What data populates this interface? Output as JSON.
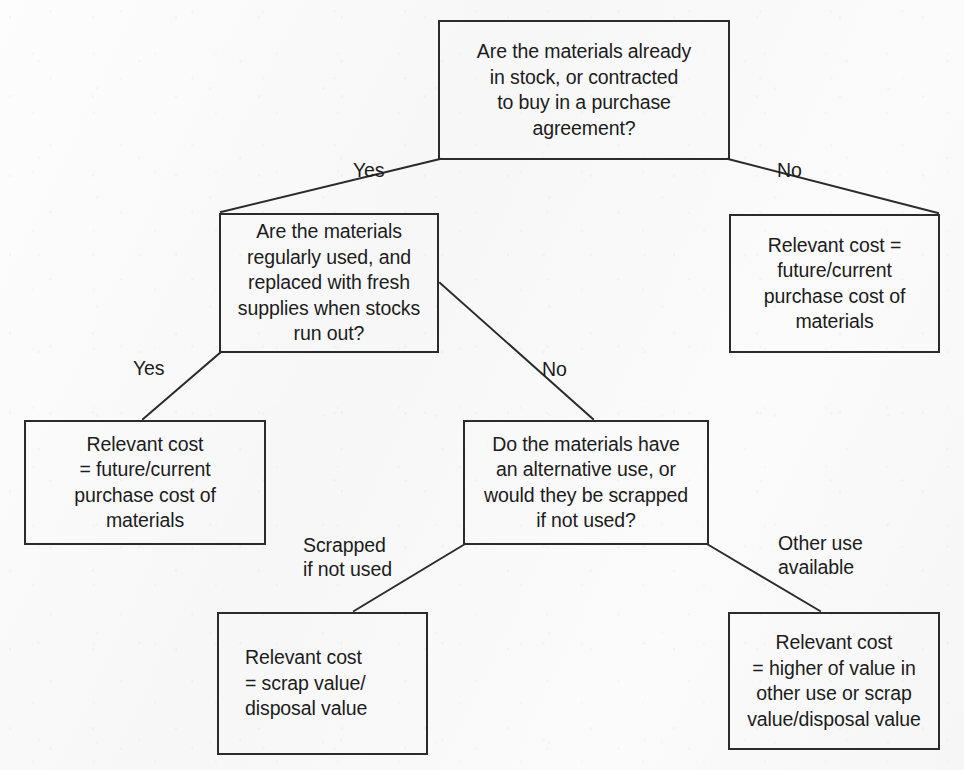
{
  "diagram": {
    "background_color": "#fafafa",
    "line_color": "#2b2b2b",
    "text_color": "#1c1c1c",
    "nodes": [
      {
        "id": "q1",
        "kind": "decision",
        "align": "center",
        "text": "Are the materials already\nin stock, or contracted\nto buy in a purchase\nagreement?",
        "x": 438,
        "y": 20,
        "w": 292,
        "h": 140
      },
      {
        "id": "q2",
        "kind": "decision",
        "align": "center",
        "text": "Are the materials\nregularly used, and\nreplaced with fresh\nsupplies when stocks\nrun out?",
        "x": 219,
        "y": 213,
        "w": 220,
        "h": 140
      },
      {
        "id": "r1",
        "kind": "outcome",
        "align": "center",
        "text": "Relevant cost =\nfuture/current\npurchase cost of\nmaterials",
        "x": 729,
        "y": 214,
        "w": 211,
        "h": 139
      },
      {
        "id": "r2",
        "kind": "outcome",
        "align": "center",
        "text": "Relevant cost\n= future/current\npurchase cost of\nmaterials",
        "x": 24,
        "y": 420,
        "w": 242,
        "h": 125
      },
      {
        "id": "q3",
        "kind": "decision",
        "align": "center",
        "text": "Do the materials have\nan alternative use, or\nwould they be scrapped\nif not used?",
        "x": 463,
        "y": 420,
        "w": 246,
        "h": 125
      },
      {
        "id": "r3",
        "kind": "outcome",
        "align": "left",
        "text": "Relevant cost\n= scrap value/\ndisposal value",
        "x": 217,
        "y": 612,
        "w": 211,
        "h": 143
      },
      {
        "id": "r4",
        "kind": "outcome",
        "align": "center",
        "text": "Relevant cost\n= higher of value in\nother use or scrap\nvalue/disposal value",
        "x": 728,
        "y": 612,
        "w": 212,
        "h": 138
      }
    ],
    "edges": [
      {
        "id": "e1",
        "from": "q1",
        "to": "q2",
        "label": "Yes",
        "x1": 440,
        "y1": 159,
        "x2": 221,
        "y2": 212
      },
      {
        "id": "e2",
        "from": "q1",
        "to": "r1",
        "label": "No",
        "x1": 728,
        "y1": 159,
        "x2": 938,
        "y2": 213
      },
      {
        "id": "e3",
        "from": "q2",
        "to": "r2",
        "label": "Yes",
        "x1": 221,
        "y1": 352,
        "x2": 143,
        "y2": 419
      },
      {
        "id": "e4",
        "from": "q2",
        "to": "q3",
        "label": "No",
        "x1": 440,
        "y1": 283,
        "x2": 593,
        "y2": 419
      },
      {
        "id": "e5",
        "from": "q3",
        "to": "r3",
        "label": "Scrapped\nif not used",
        "x1": 465,
        "y1": 544,
        "x2": 354,
        "y2": 611
      },
      {
        "id": "e6",
        "from": "q3",
        "to": "r4",
        "label": "Other use\navailable",
        "x1": 707,
        "y1": 544,
        "x2": 820,
        "y2": 611
      }
    ],
    "edge_labels": [
      {
        "id": "l1",
        "text": "Yes",
        "x": 353,
        "y": 158
      },
      {
        "id": "l2",
        "text": "No",
        "x": 777,
        "y": 158
      },
      {
        "id": "l3",
        "text": "Yes",
        "x": 133,
        "y": 356
      },
      {
        "id": "l4",
        "text": "No",
        "x": 542,
        "y": 357
      },
      {
        "id": "l5",
        "text": "Scrapped\nif not used",
        "x": 303,
        "y": 533
      },
      {
        "id": "l6",
        "text": "Other use\navailable",
        "x": 778,
        "y": 531
      }
    ]
  }
}
